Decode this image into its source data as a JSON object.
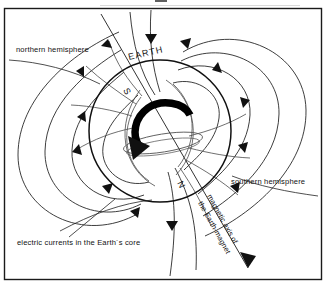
{
  "figure": {
    "title": "",
    "background_color": "#ffffff",
    "line_color": "#1b1b1b",
    "frame_color": "#1a1a1a"
  },
  "labels": {
    "northern_hemisphere": "northern hemisphere",
    "southern_hemisphere": "southern hemisphere",
    "earth": "EARTH",
    "pole_south": "S",
    "pole_north": "N",
    "electric_currents": "electric currents in the Earth´s core",
    "magnetic_axis_line1": "magnetic axis of",
    "magnetic_axis_line2": "the Earth-magnet"
  },
  "diagram": {
    "type": "schematic",
    "globe": {
      "center_x": 160,
      "center_y": 131,
      "radius": 71
    },
    "magnetic_axis": {
      "tilt_degrees": 28,
      "north_pole_end": "lower-right",
      "south_pole_end": "upper-left"
    },
    "core_current": {
      "description": "thick arc with arrowhead indicating electric current loop in the Earth's core",
      "arrow_direction": "counter-clockwise toward lower-left"
    },
    "field_lines": {
      "count": 14,
      "arrow_direction": "from southern hemisphere outward and into northern hemisphere"
    }
  }
}
